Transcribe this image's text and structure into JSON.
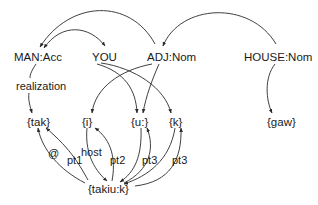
{
  "nodes": {
    "man_acc": "MAN:Acc",
    "you": "YOU",
    "adj_nom": "ADJ:Nom",
    "house_nom": "HOUSE:Nom",
    "tak": "{tak}",
    "i": "{i}",
    "u": "{u:}",
    "k": "{k}",
    "gaw": "{gaw}",
    "takiuk": "{takiu:k}"
  },
  "edge_labels": {
    "realization": "realization",
    "at": "@",
    "pt1": "pt1",
    "host": "host",
    "pt2": "pt2",
    "pt3_a": "pt3",
    "pt3_b": "pt3"
  },
  "colors": {
    "line": "#2a2a2a",
    "text": "#1a1a1a",
    "background": "#ffffff"
  }
}
